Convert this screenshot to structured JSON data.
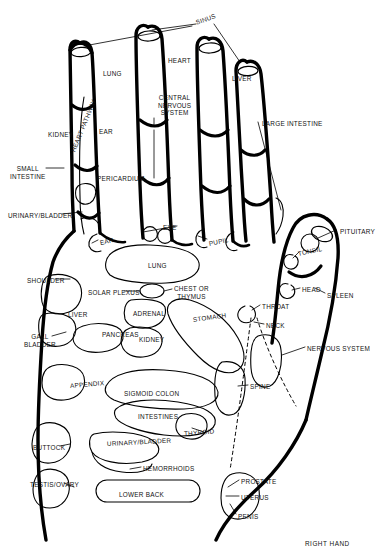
{
  "caption": {
    "text": "RIGHT HAND",
    "x": 305,
    "y": 543
  },
  "colors": {
    "ink": "#111111",
    "background": "#ffffff",
    "outline": "#000000"
  },
  "zones": {
    "fingers": [
      {
        "name": "sinus",
        "label": "SINUS",
        "x": 196,
        "y": 19,
        "rot": -20
      },
      {
        "name": "heart",
        "label": "HEART",
        "x": 168,
        "y": 57,
        "rot": 0
      },
      {
        "name": "lung-finger",
        "label": "LUNG",
        "x": 103,
        "y": 70,
        "rot": 0
      },
      {
        "name": "liver-finger",
        "label": "LIVER",
        "x": 232,
        "y": 75,
        "rot": 0
      },
      {
        "name": "central-nervous-system",
        "label": "CENTRAL\nNERVOUS\nSYSTEM",
        "x": 158,
        "y": 94,
        "rot": 0
      },
      {
        "name": "kidney-finger",
        "label": "KIDNEY",
        "x": 48,
        "y": 131,
        "rot": 0
      },
      {
        "name": "ear-finger",
        "label": "EAR",
        "x": 99,
        "y": 128,
        "rot": 0
      },
      {
        "name": "heart-pathway",
        "label": "HEART PATHWAY",
        "x": 73,
        "y": 148,
        "rot": -68
      },
      {
        "name": "large-intestine",
        "label": "LARGE INTESTINE",
        "x": 262,
        "y": 120,
        "rot": 0
      },
      {
        "name": "small-intestine",
        "label": "SMALL\nINTESTINE",
        "x": 10,
        "y": 165,
        "rot": 0
      },
      {
        "name": "pericardium",
        "label": "PERICARDIUM",
        "x": 97,
        "y": 175,
        "rot": 0
      },
      {
        "name": "urinary-bladder-finger",
        "label": "URINARY/BLADDER",
        "x": 8,
        "y": 212,
        "rot": 0
      },
      {
        "name": "eye",
        "label": "EYE",
        "x": 163,
        "y": 224,
        "rot": 0
      },
      {
        "name": "ear-palm",
        "label": "EAR",
        "x": 100,
        "y": 239,
        "rot": -12
      },
      {
        "name": "pupil",
        "label": "PUPIL",
        "x": 209,
        "y": 240,
        "rot": -12
      }
    ],
    "thumb": [
      {
        "name": "pituitary",
        "label": "PITUITARY",
        "x": 340,
        "y": 228,
        "rot": 0
      },
      {
        "name": "tonsil",
        "label": "TONSIL",
        "x": 298,
        "y": 250,
        "rot": -12
      },
      {
        "name": "head",
        "label": "HEAD",
        "x": 302,
        "y": 286,
        "rot": 0
      },
      {
        "name": "spleen",
        "label": "SPLEEN",
        "x": 327,
        "y": 292,
        "rot": 0
      },
      {
        "name": "throat",
        "label": "THROAT",
        "x": 262,
        "y": 303,
        "rot": 0
      },
      {
        "name": "neck",
        "label": "NECK",
        "x": 266,
        "y": 322,
        "rot": 0
      }
    ],
    "palm": [
      {
        "name": "shoulder",
        "label": "SHOULDER",
        "x": 27,
        "y": 277,
        "rot": 0
      },
      {
        "name": "lung-palm",
        "label": "LUNG",
        "x": 148,
        "y": 262,
        "rot": 0
      },
      {
        "name": "solar-plexus",
        "label": "SOLAR PLEXUS",
        "x": 88,
        "y": 289,
        "rot": 0
      },
      {
        "name": "chest-or-thymus",
        "label": "CHEST OR\nTHYMUS",
        "x": 174,
        "y": 285,
        "rot": 0
      },
      {
        "name": "liver-palm",
        "label": "LIVER",
        "x": 68,
        "y": 311,
        "rot": 0
      },
      {
        "name": "adrenal",
        "label": "ADRENAL",
        "x": 133,
        "y": 310,
        "rot": 0
      },
      {
        "name": "stomach",
        "label": "STOMACH",
        "x": 193,
        "y": 316,
        "rot": -8
      },
      {
        "name": "gall-bladder",
        "label": "GALL\nBLADDER",
        "x": 24,
        "y": 333,
        "rot": 0
      },
      {
        "name": "pancreas",
        "label": "PANCREAS",
        "x": 102,
        "y": 331,
        "rot": 0
      },
      {
        "name": "kidney-palm",
        "label": "KIDNEY",
        "x": 139,
        "y": 336,
        "rot": 0
      },
      {
        "name": "nervous-system",
        "label": "NERVOUS SYSTEM",
        "x": 307,
        "y": 345,
        "rot": 0
      },
      {
        "name": "appendix",
        "label": "APPENDIX",
        "x": 70,
        "y": 382,
        "rot": -5
      },
      {
        "name": "sigmoid-colon",
        "label": "SIGMOID COLON",
        "x": 124,
        "y": 390,
        "rot": 0
      },
      {
        "name": "intestines",
        "label": "INTESTINES",
        "x": 138,
        "y": 413,
        "rot": 0
      },
      {
        "name": "spine",
        "label": "SPINE",
        "x": 250,
        "y": 383,
        "rot": 0
      },
      {
        "name": "thyroid",
        "label": "THYROID",
        "x": 184,
        "y": 430,
        "rot": -5
      },
      {
        "name": "buttock",
        "label": "BUTTOCK",
        "x": 33,
        "y": 444,
        "rot": 0
      },
      {
        "name": "urinary-bladder-palm",
        "label": "URINARY/BLADDER",
        "x": 107,
        "y": 440,
        "rot": -3
      },
      {
        "name": "hemorrhoids",
        "label": "HEMORRHOIDS",
        "x": 143,
        "y": 465,
        "rot": 0
      },
      {
        "name": "testis-ovary",
        "label": "TESTIS/OVARY",
        "x": 30,
        "y": 481,
        "rot": 0
      },
      {
        "name": "lower-back",
        "label": "LOWER BACK",
        "x": 119,
        "y": 491,
        "rot": 0
      },
      {
        "name": "prostate",
        "label": "PROSTATE",
        "x": 241,
        "y": 478,
        "rot": 0
      },
      {
        "name": "uterus",
        "label": "UTERUS",
        "x": 241,
        "y": 494,
        "rot": 0
      },
      {
        "name": "penis",
        "label": "PENIS",
        "x": 238,
        "y": 513,
        "rot": 0
      }
    ]
  }
}
